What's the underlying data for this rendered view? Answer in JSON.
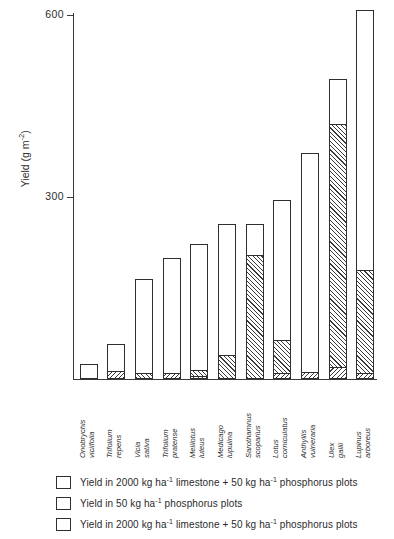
{
  "chart_data": {
    "type": "bar",
    "title": "",
    "xlabel": "",
    "ylabel": "Yield (g m⁻²)",
    "ylabel_base": "Yield (g m",
    "ylabel_exp": "-2",
    "ylabel_close": ")",
    "ylim": [
      0,
      620
    ],
    "yticks": [
      300,
      600
    ],
    "ytick_labels": [
      "300",
      "600"
    ],
    "grid": false,
    "legend_position": "below-plot",
    "stacked": true,
    "categories": [
      "Onobrychis viciifolia",
      "Trifolium repens",
      "Vicia sativa",
      "Trifolium pratense",
      "Melilotus luteus",
      "Medicago lupulina",
      "Sarothamnus scoparius",
      "Lotus corniculatus",
      "Anthyllis vulneraria",
      "Ulex gallii",
      "Lupinus arboreus"
    ],
    "category_lines": [
      [
        "Onobrychis",
        "viciifolia"
      ],
      [
        "Trifolium",
        "repens"
      ],
      [
        "Vicia",
        "sativa"
      ],
      [
        "Trifolium",
        "pratense"
      ],
      [
        "Melilotus",
        "luteus"
      ],
      [
        "Medicago",
        "lupulina"
      ],
      [
        "Sarothamnus",
        "scoparius"
      ],
      [
        "Lotus",
        "corniculatus"
      ],
      [
        "Anthyllis",
        "vulneraria"
      ],
      [
        "Ulex",
        "gallii"
      ],
      [
        "Lupinus",
        "arboreus"
      ]
    ],
    "series": [
      {
        "name": "Yield in 2000 kg ha⁻¹ limestone + 50 kg ha⁻¹ phosphorus plots",
        "pattern": "open",
        "values": [
          25,
          58,
          165,
          200,
          222,
          255,
          255,
          295,
          372,
          495,
          608
        ]
      },
      {
        "name": "Yield in 50 kg ha⁻¹ phosphorus plots",
        "pattern": "forward-hatch",
        "values": [
          0,
          0,
          10,
          0,
          15,
          40,
          205,
          65,
          0,
          420,
          180
        ]
      },
      {
        "name": "Yield in 2000 kg ha⁻¹ limestone + 50 kg ha⁻¹ phosphorus plots",
        "pattern": "back-hatch",
        "values": [
          0,
          14,
          0,
          10,
          5,
          0,
          0,
          10,
          12,
          20,
          10
        ]
      }
    ]
  },
  "legend": {
    "items": [
      {
        "swatch": "open",
        "text_a": "Yield in 2000 kg ha",
        "exp_a": "-1",
        "text_b": " limestone + 50 kg ha",
        "exp_b": "-1",
        "text_c": " phosphorus plots"
      },
      {
        "swatch": "forward-hatch",
        "text_a": "Yield in 50 kg ha",
        "exp_a": "-1",
        "text_b": " phosphorus plots",
        "exp_b": "",
        "text_c": ""
      },
      {
        "swatch": "back-hatch",
        "text_a": "Yield in 2000 kg ha",
        "exp_a": "-1",
        "text_b": " limestone + 50 kg ha",
        "exp_b": "-1",
        "text_c": " phosphorus plots"
      }
    ]
  },
  "colors": {
    "ink": "#2e2e2e",
    "background": "#ffffff",
    "hatch": "#3a3a3a"
  }
}
